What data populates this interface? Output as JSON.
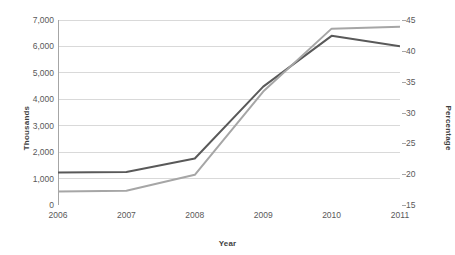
{
  "chart_data": {
    "type": "line",
    "title": "",
    "subtitle": "",
    "xlabel": "Year",
    "ylabel": "Thousands",
    "y2label": "Percentage",
    "categories": [
      "2006",
      "2007",
      "2008",
      "2009",
      "2010",
      "2011"
    ],
    "x": [
      2006,
      2007,
      2008,
      2009,
      2010,
      2011
    ],
    "series": [
      {
        "name": "Thousands",
        "axis": "left",
        "color": "#595959",
        "values": [
          1230,
          1250,
          1760,
          4480,
          6400,
          6010
        ]
      },
      {
        "name": "Percentage",
        "axis": "right",
        "color": "#a6a6a6",
        "values": [
          17.2,
          17.3,
          19.9,
          33.4,
          43.6,
          43.9
        ]
      }
    ],
    "ylim": [
      0,
      7000
    ],
    "yticks": [
      0,
      1000,
      2000,
      3000,
      4000,
      5000,
      6000,
      7000
    ],
    "ytick_labels": [
      "0",
      "1,000",
      "2,000",
      "3,000",
      "4,000",
      "5,000",
      "6,000",
      "7,000"
    ],
    "y2lim": [
      15,
      45
    ],
    "y2ticks": [
      15,
      20,
      25,
      30,
      35,
      40,
      45
    ],
    "y2tick_labels": [
      "15",
      "20",
      "25",
      "30",
      "35",
      "40",
      "45"
    ],
    "grid": true,
    "gridline_color": "#d9d9d9",
    "axis_color": "#a6a6a6",
    "legend": "none",
    "plot_background": "#ffffff"
  }
}
